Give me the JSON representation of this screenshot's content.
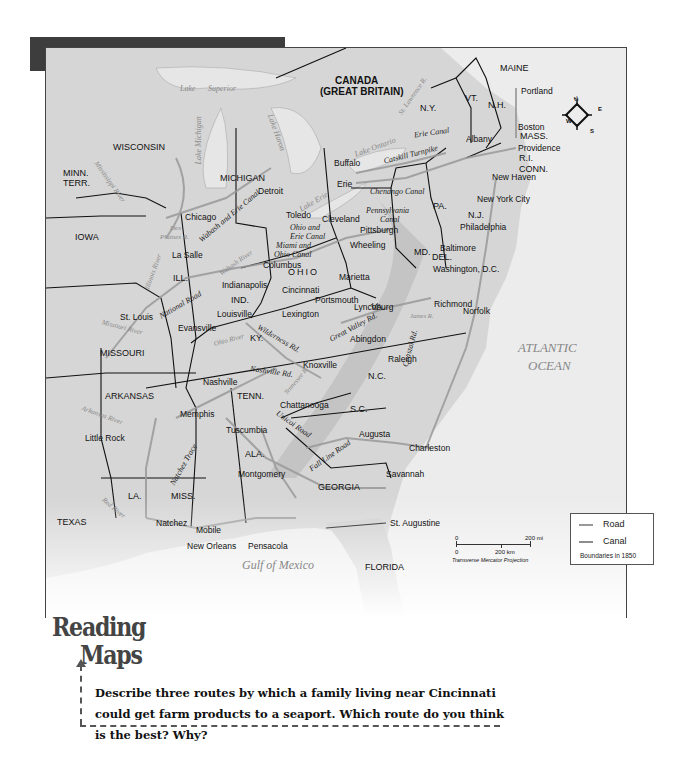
{
  "title": "Roads and Canals   1830–1850",
  "map": {
    "countries": {
      "canada_line1": "CANADA",
      "canada_line2": "(GREAT BRITAIN)"
    },
    "states": {
      "wisconsin": "WISCONSIN",
      "minn_terr_1": "MINN.",
      "minn_terr_2": "TERR.",
      "michigan": "MICHIGAN",
      "iowa": "IOWA",
      "ill": "ILL.",
      "ind": "IND.",
      "ohio": "OHIO",
      "ky": "KY.",
      "missouri": "MISSOURI",
      "arkansas": "ARKANSAS",
      "tenn": "TENN.",
      "texas": "TEXAS",
      "la": "LA.",
      "miss": "MISS.",
      "ala": "ALA.",
      "georgia": "GEORGIA",
      "florida": "FLORIDA",
      "sc": "S.C.",
      "nc": "N.C.",
      "va": "VA.",
      "md": "MD.",
      "del": "DEL.",
      "pa": "PA.",
      "nj": "N.J.",
      "ny": "N.Y.",
      "vt": "VT.",
      "nh": "N.H.",
      "maine": "MAINE",
      "mass": "MASS.",
      "ri": "R.I.",
      "conn": "CONN."
    },
    "cities": {
      "portland": "Portland",
      "boston": "Boston",
      "providence": "Providence",
      "albany": "Albany",
      "new_haven": "New Haven",
      "new_york": "New York City",
      "buffalo": "Buffalo",
      "erie": "Erie",
      "philadelphia": "Philadelphia",
      "baltimore": "Baltimore",
      "washington": "Washington, D.C.",
      "richmond": "Richmond",
      "norfolk": "Norfolk",
      "pittsburgh": "Pittsburgh",
      "wheeling": "Wheeling",
      "cleveland": "Cleveland",
      "toledo": "Toledo",
      "detroit": "Detroit",
      "chicago": "Chicago",
      "la_salle": "La Salle",
      "columbus": "Columbus",
      "indianapolis": "Indianapolis",
      "cincinnati": "Cincinnati",
      "marietta": "Marietta",
      "portsmouth": "Portsmouth",
      "lynchburg": "Lynchburg",
      "louisville": "Louisville",
      "lexington": "Lexington",
      "evansville": "Evansville",
      "st_louis": "St. Louis",
      "abingdon": "Abingdon",
      "raleigh": "Raleigh",
      "knoxville": "Knoxville",
      "nashville": "Nashville",
      "memphis": "Memphis",
      "little_rock": "Little Rock",
      "chattanooga": "Chattanooga",
      "tuscumbia": "Tuscumbia",
      "augusta": "Augusta",
      "charleston": "Charleston",
      "savannah": "Savannah",
      "montgomery": "Montgomery",
      "natchez": "Natchez",
      "mobile": "Mobile",
      "new_orleans": "New Orleans",
      "pensacola": "Pensacola",
      "st_augustine": "St. Augustine"
    },
    "routes": {
      "erie_canal": "Erie Canal",
      "catskill": "Catskill Turnpike",
      "chenango": "Chenango Canal",
      "penn_canal_1": "Pennsylvania",
      "penn_canal_2": "Canal",
      "ohio_erie_1": "Ohio and",
      "ohio_erie_2": "Erie Canal",
      "miami_ohio_1": "Miami and",
      "miami_ohio_2": "Ohio Canal",
      "wabash_erie": "Wabash and Erie Canal",
      "national_road": "National Road",
      "wilderness": "Wilderness Rd.",
      "great_valley": "Great Valley Rd.",
      "nashville_rd": "Nashville Rd.",
      "natchez_trace": "Natchez Trace",
      "unicoi": "Unicoi Road",
      "fall_line": "Fall Line Road",
      "coastal": "Coastal Rd."
    },
    "water": {
      "lake_superior_1": "Lake",
      "lake_superior_2": "Superior",
      "lake_michigan": "Lake Michigan",
      "lake_huron": "Lake Huron",
      "lake_erie": "Lake Erie",
      "lake_ontario": "Lake Ontario",
      "st_lawrence": "St. Lawrence R.",
      "mississippi": "Mississippi River",
      "des_plaines_1": "Des",
      "des_plaines_2": "Plaines R.",
      "illinois_river": "Illinois River",
      "wabash_river": "Wabash River",
      "missouri_river": "Missouri River",
      "ohio_river": "Ohio River",
      "arkansas_river": "Arkansas River",
      "red_river": "Red River",
      "tennessee_river": "Tennessee R.",
      "james_river": "James R.",
      "atlantic_1": "ATLANTIC",
      "atlantic_2": "OCEAN",
      "gulf": "Gulf of Mexico"
    },
    "compass": {
      "n": "N",
      "e": "E",
      "s": "S",
      "w": "W"
    },
    "scale": {
      "mi_zero": "0",
      "mi_label": "200 mi",
      "km_zero": "0",
      "km_label": "200 km",
      "projection": "Transverse Mercator Projection"
    },
    "legend": {
      "road": "Road",
      "canal": "Canal",
      "note": "Boundaries in 1850",
      "road_color": "#999999",
      "canal_color": "#8c8c8c"
    }
  },
  "reading_maps": {
    "heading_1": "Reading",
    "heading_2": "Maps",
    "question": "Describe three routes by which a family living near Cincinnati could get farm products to a seaport. Which route do you think is the best? Why?"
  },
  "colors": {
    "banner": "#3d3d3d",
    "land": "#d9d9d9",
    "ocean": "#ececec",
    "border": "#111111",
    "route": "#999999"
  }
}
